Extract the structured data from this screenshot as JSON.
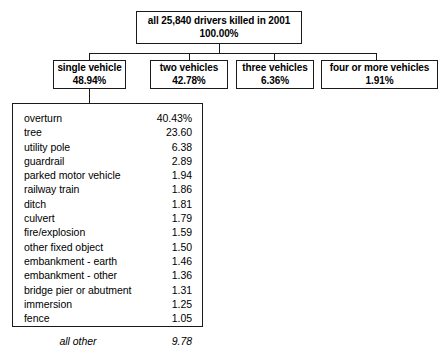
{
  "chart_data": {
    "type": "diagram",
    "title": "all 25,840 drivers killed in 2001",
    "root": {
      "label": "all 25,840 drivers killed in 2001",
      "percent": "100.00%"
    },
    "branches": [
      {
        "label": "single vehicle",
        "percent": "48.94%"
      },
      {
        "label": "two vehicles",
        "percent": "42.78%"
      },
      {
        "label": "three vehicles",
        "percent": "6.36%"
      },
      {
        "label": "four or more vehicles",
        "percent": "1.91%"
      }
    ],
    "detail_parent": "single vehicle",
    "categories": [
      "overturn",
      "tree",
      "utility pole",
      "guardrail",
      "parked motor vehicle",
      "railway train",
      "ditch",
      "culvert",
      "fire/explosion",
      "other fixed object",
      "embankment - earth",
      "embankment - other",
      "bridge pier or abutment",
      "immersion",
      "fence",
      "all other"
    ],
    "values": [
      40.43,
      23.6,
      6.38,
      2.89,
      1.94,
      1.86,
      1.81,
      1.79,
      1.59,
      1.5,
      1.46,
      1.36,
      1.31,
      1.25,
      1.05,
      9.78
    ],
    "ylabel": "percent of single-vehicle driver fatalities"
  },
  "root_box": {
    "line1": "all 25,840 drivers killed in 2001",
    "line2": "100.00%"
  },
  "branch_boxes": [
    {
      "line1": "single vehicle",
      "line2": "48.94%"
    },
    {
      "line1": "two vehicles",
      "line2": "42.78%"
    },
    {
      "line1": "three vehicles",
      "line2": "6.36%"
    },
    {
      "line1": "four or more vehicles",
      "line2": "1.91%"
    }
  ],
  "detail_rows": [
    {
      "label": "overturn",
      "value": "40.43%"
    },
    {
      "label": "tree",
      "value": "23.60"
    },
    {
      "label": "utility pole",
      "value": "6.38"
    },
    {
      "label": "guardrail",
      "value": "2.89"
    },
    {
      "label": "parked motor vehicle",
      "value": "1.94"
    },
    {
      "label": "railway train",
      "value": "1.86"
    },
    {
      "label": "ditch",
      "value": "1.81"
    },
    {
      "label": "culvert",
      "value": "1.79"
    },
    {
      "label": "fire/explosion",
      "value": "1.59"
    },
    {
      "label": "other fixed object",
      "value": "1.50"
    },
    {
      "label": "embankment - earth",
      "value": "1.46"
    },
    {
      "label": "embankment - other",
      "value": "1.36"
    },
    {
      "label": "bridge pier or abutment",
      "value": "1.31"
    },
    {
      "label": "immersion",
      "value": "1.25"
    },
    {
      "label": "fence",
      "value": "1.05"
    },
    {
      "label": "all other",
      "value": "9.78"
    }
  ],
  "colors": {
    "stroke": "#1a1a1a",
    "background": "#ffffff",
    "text": "#000000"
  }
}
